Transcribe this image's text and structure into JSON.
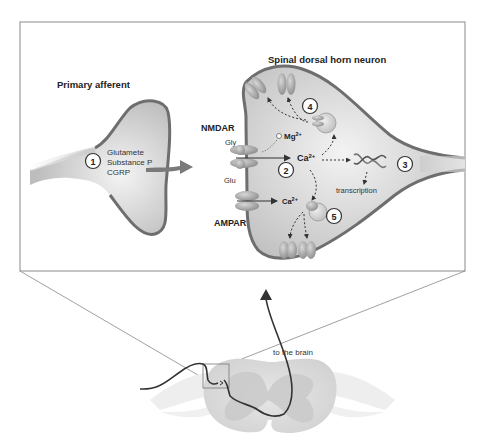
{
  "figure": {
    "titles": {
      "primary_afferent": "Primary afferent",
      "dorsal_horn_neuron": "Spinal dorsal horn neuron"
    },
    "receptors": {
      "nmdar": "NMDAR",
      "ampar": "AMPAR",
      "gly": "Gly",
      "glu": "Glu"
    },
    "ions": {
      "mg": "Mg",
      "mg_charge": "2+",
      "ca_main": "Ca",
      "ca_main_charge": "2+",
      "ca_ampar": "Ca",
      "ca_ampar_charge": "2+"
    },
    "transmitters": [
      "Glutamete",
      "Substance P",
      "CGRP"
    ],
    "labels": {
      "transcription": "transcription",
      "to_brain": "to the brain"
    },
    "steps": [
      "1",
      "2",
      "3",
      "4",
      "5"
    ],
    "colors": {
      "membrane": "#6e6e6e",
      "cell_fill": "#c9c9c9",
      "cell_highlight": "#f2f2f2",
      "receptor": "#9a9a9a",
      "box_border": "#8a8a8a",
      "pathway": "#333333"
    }
  }
}
